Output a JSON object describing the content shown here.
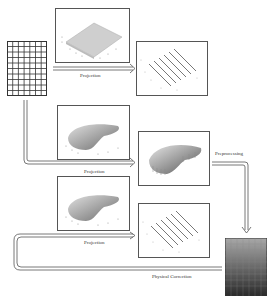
{
  "diagram": {
    "type": "flow",
    "nodes": [
      {
        "id": "input-grid",
        "kind": "grid",
        "cols": 7,
        "rows": 10
      },
      {
        "id": "plot-flat-surface",
        "kind": "3d-surface-plot",
        "shape": "flat-plane"
      },
      {
        "id": "plot-fringe-1",
        "kind": "3d-line-plot",
        "shape": "parallel-ridges"
      },
      {
        "id": "plot-curved-surface-1",
        "kind": "3d-surface-plot",
        "shape": "curved-sheet"
      },
      {
        "id": "plot-curved-fringe",
        "kind": "3d-surface-plot",
        "shape": "curved-ridged-sheet"
      },
      {
        "id": "plot-curved-surface-2",
        "kind": "3d-surface-plot",
        "shape": "curved-sheet"
      },
      {
        "id": "plot-fringe-2",
        "kind": "3d-line-plot",
        "shape": "parallel-ridges"
      },
      {
        "id": "output-gradient-grid",
        "kind": "gradient-grid"
      }
    ],
    "edges": [
      {
        "from": "input-grid",
        "to": "plot-fringe-1",
        "label": "Projection"
      },
      {
        "from": "input-grid",
        "to": "plot-curved-fringe",
        "label": "Projection"
      },
      {
        "from": "plot-curved-fringe",
        "to": "output-gradient-grid",
        "label": "Preprocessing"
      },
      {
        "from": "output-gradient-grid",
        "to": "plot-fringe-2",
        "label": "Projection"
      },
      {
        "from": "plot-fringe-2",
        "to": "output-gradient-grid",
        "label": "Physical Correction"
      }
    ]
  },
  "labels": {
    "projection_1": "Projection",
    "projection_2": "Projection",
    "projection_3": "Projection",
    "preprocessing": "Preprocessing",
    "physical_correction": "Physical Correction"
  },
  "colors": {
    "line": "#555555",
    "surface_light": "#d8d8d8",
    "surface_dark": "#7a7a7a",
    "gradient_top": "#a8a8a8",
    "gradient_bottom": "#2a2a2a"
  }
}
